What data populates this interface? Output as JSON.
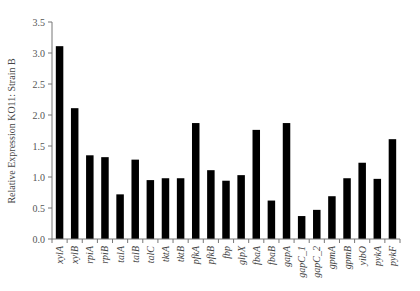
{
  "chart_data": {
    "type": "bar",
    "title": "",
    "xlabel": "",
    "ylabel": "Relative Expression KO11: Strain B",
    "ylim": [
      0,
      3.5
    ],
    "yticks": [
      0.0,
      0.5,
      1.0,
      1.5,
      2.0,
      2.5,
      3.0,
      3.5
    ],
    "ytick_labels": [
      "0.0",
      "0.5",
      "1.0",
      "1.5",
      "2.0",
      "2.5",
      "3.0",
      "3.5"
    ],
    "grid": false,
    "legend": null,
    "bar_color": "#000000",
    "categories": [
      "xylA",
      "xylB",
      "rpiA",
      "rpiB",
      "talA",
      "talB",
      "talC",
      "tktA",
      "tktB",
      "pfkA",
      "pfkB",
      "fbp",
      "glpX",
      "fbaA",
      "fbaB",
      "gapA",
      "gapC_1",
      "gapC_2",
      "gpmA",
      "gpmB",
      "yibO",
      "pykA",
      "pykF"
    ],
    "values": [
      3.11,
      2.11,
      1.35,
      1.32,
      0.72,
      1.28,
      0.95,
      0.98,
      0.98,
      1.87,
      1.11,
      0.94,
      1.03,
      1.76,
      0.62,
      1.87,
      0.37,
      0.47,
      0.69,
      0.98,
      1.23,
      0.97,
      1.61
    ]
  }
}
